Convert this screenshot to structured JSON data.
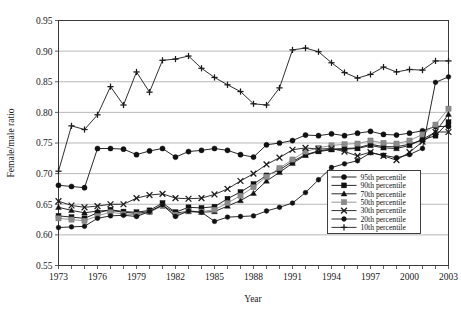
{
  "chart_data": {
    "type": "line",
    "title": "",
    "xlabel": "Year",
    "ylabel": "Female/male ratio",
    "xlim": [
      1973,
      2003
    ],
    "ylim": [
      0.55,
      0.95
    ],
    "yticks": [
      0.55,
      0.6,
      0.65,
      0.7,
      0.75,
      0.8,
      0.85,
      0.9,
      0.95
    ],
    "ytick_labels": [
      "0.55",
      "0.60",
      "0.65",
      "0.70",
      "0.75",
      "0.80",
      "0.85",
      "0.90",
      "0.95"
    ],
    "xticks": [
      1973,
      1974,
      1975,
      1976,
      1977,
      1978,
      1979,
      1980,
      1981,
      1982,
      1983,
      1984,
      1985,
      1986,
      1987,
      1988,
      1989,
      1990,
      1991,
      1992,
      1993,
      1994,
      1995,
      1996,
      1997,
      1998,
      1999,
      2000,
      2001,
      2002,
      2003
    ],
    "xtick_labels": [
      "1973",
      "",
      "",
      "1976",
      "",
      "",
      "1979",
      "",
      "",
      "1982",
      "",
      "",
      "1985",
      "",
      "",
      "1988",
      "",
      "",
      "1991",
      "",
      "",
      "1994",
      "",
      "",
      "1997",
      "",
      "",
      "2000",
      "",
      "",
      "2003"
    ],
    "grid": "horizontal",
    "legend_position": "bottom-right",
    "x": [
      1973,
      1974,
      1975,
      1976,
      1977,
      1978,
      1979,
      1980,
      1981,
      1982,
      1983,
      1984,
      1985,
      1986,
      1987,
      1988,
      1989,
      1990,
      1991,
      1992,
      1993,
      1994,
      1995,
      1996,
      1997,
      1998,
      1999,
      2000,
      2001,
      2002,
      2003
    ],
    "series": [
      {
        "name": "95th percentile",
        "marker": "filled-circle",
        "color": "#111111",
        "values": [
          0.681,
          0.679,
          0.677,
          0.741,
          0.741,
          0.74,
          0.731,
          0.737,
          0.741,
          0.727,
          0.736,
          0.738,
          0.741,
          0.738,
          0.731,
          0.727,
          0.747,
          0.75,
          0.754,
          0.763,
          0.762,
          0.765,
          0.762,
          0.766,
          0.769,
          0.764,
          0.763,
          0.766,
          0.77,
          0.777,
          0.777
        ]
      },
      {
        "name": "90th percentile",
        "marker": "filled-square",
        "color": "#111111",
        "values": [
          0.631,
          0.629,
          0.627,
          0.636,
          0.641,
          0.638,
          0.637,
          0.64,
          0.652,
          0.637,
          0.645,
          0.644,
          0.646,
          0.659,
          0.67,
          0.683,
          0.697,
          0.706,
          0.72,
          0.731,
          0.737,
          0.74,
          0.741,
          0.742,
          0.748,
          0.744,
          0.744,
          0.748,
          0.755,
          0.762,
          0.784
        ]
      },
      {
        "name": "70th percentile",
        "marker": "filled-triangle",
        "color": "#111111",
        "values": [
          0.645,
          0.64,
          0.636,
          0.639,
          0.64,
          0.637,
          0.635,
          0.638,
          0.648,
          0.636,
          0.638,
          0.637,
          0.638,
          0.647,
          0.656,
          0.668,
          0.688,
          0.702,
          0.717,
          0.73,
          0.736,
          0.739,
          0.74,
          0.741,
          0.746,
          0.742,
          0.741,
          0.746,
          0.756,
          0.768,
          0.797
        ]
      },
      {
        "name": "50th percentile",
        "marker": "gray-square",
        "color": "#8c8c8c",
        "values": [
          0.627,
          0.625,
          0.623,
          0.631,
          0.637,
          0.634,
          0.633,
          0.637,
          0.647,
          0.633,
          0.639,
          0.638,
          0.641,
          0.652,
          0.664,
          0.678,
          0.695,
          0.709,
          0.723,
          0.736,
          0.742,
          0.746,
          0.748,
          0.749,
          0.754,
          0.75,
          0.749,
          0.754,
          0.764,
          0.78,
          0.806
        ]
      },
      {
        "name": "30th percentile",
        "marker": "cross-x",
        "color": "#1a1a1a",
        "values": [
          0.655,
          0.648,
          0.645,
          0.647,
          0.65,
          0.65,
          0.66,
          0.665,
          0.667,
          0.66,
          0.659,
          0.66,
          0.666,
          0.675,
          0.688,
          0.7,
          0.715,
          0.726,
          0.739,
          0.742,
          0.74,
          0.741,
          0.736,
          0.729,
          0.735,
          0.729,
          0.722,
          0.735,
          0.752,
          0.768,
          0.768
        ]
      },
      {
        "name": "20th percentile",
        "marker": "filled-circle-sm",
        "color": "#111111",
        "values": [
          0.612,
          0.613,
          0.614,
          0.627,
          0.631,
          0.632,
          0.63,
          0.638,
          0.649,
          0.63,
          0.639,
          0.637,
          0.622,
          0.629,
          0.63,
          0.631,
          0.639,
          0.645,
          0.652,
          0.669,
          0.69,
          0.71,
          0.716,
          0.721,
          0.734,
          0.73,
          0.726,
          0.731,
          0.741,
          0.849,
          0.858
        ]
      },
      {
        "name": "10th percentile",
        "marker": "plus",
        "color": "#1a1a1a",
        "values": [
          0.704,
          0.778,
          0.772,
          0.796,
          0.842,
          0.812,
          0.866,
          0.833,
          0.885,
          0.887,
          0.892,
          0.872,
          0.857,
          0.845,
          0.834,
          0.814,
          0.812,
          0.84,
          0.902,
          0.905,
          0.899,
          0.881,
          0.865,
          0.856,
          0.862,
          0.874,
          0.866,
          0.87,
          0.869,
          0.884,
          0.884
        ]
      }
    ]
  },
  "legend": {
    "items": [
      {
        "label": "95th percentile"
      },
      {
        "label": "90th percentile"
      },
      {
        "label": "70th percentile"
      },
      {
        "label": "50th percentile"
      },
      {
        "label": "30th percentile"
      },
      {
        "label": "20th percentile"
      },
      {
        "label": "10th percentile"
      }
    ]
  },
  "axes": {
    "x_title": "Year",
    "y_title": "Female/male ratio"
  }
}
